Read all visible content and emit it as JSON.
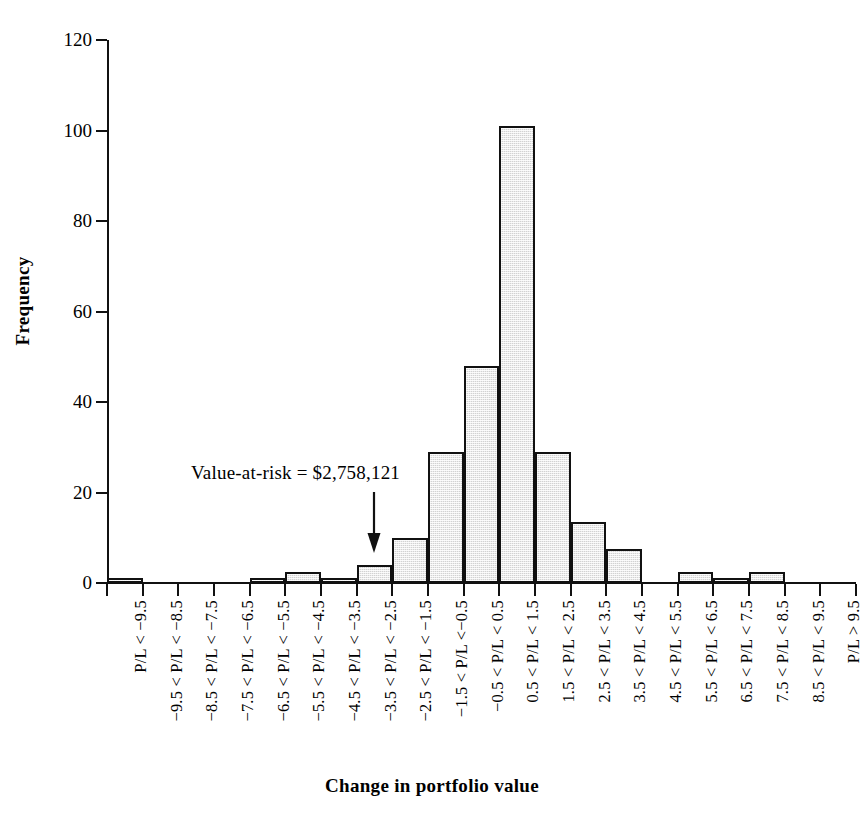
{
  "chart_data": {
    "type": "bar",
    "title": "",
    "subtitle": "",
    "xlabel": "Change in portfolio value",
    "ylabel": "Frequency",
    "ylim": [
      0,
      120
    ],
    "ytick_labels": [
      "0",
      "20",
      "40",
      "60",
      "80",
      "100",
      "120"
    ],
    "ytick_values": [
      0,
      20,
      40,
      60,
      80,
      100,
      120
    ],
    "grid": false,
    "legend": null,
    "bar_fill_color": "#d2d2d2",
    "bar_edge_color": "#111111",
    "categories": [
      "P/L < −9.5",
      "−9.5 < P/L < −8.5",
      "−8.5 < P/L < −7.5",
      "−7.5 < P/L < −6.5",
      "−6.5 < P/L < −5.5",
      "−5.5 < P/L < −4.5",
      "−4.5 < P/L < −3.5",
      "−3.5 < P/L < −2.5",
      "−2.5 < P/L < −1.5",
      "−1.5 < P/L <−0.5",
      "−0.5 < P/L < 0.5",
      "0.5 < P/L < 1.5",
      "1.5 < P/L < 2.5",
      "2.5 < P/L < 3.5",
      "3.5 < P/L < 4.5",
      "4.5 < P/L < 5.5",
      "5.5 < P/L < 6.5",
      "6.5 < P/L < 7.5",
      "7.5 < P/L < 8.5",
      "8.5 < P/L < 9.5",
      "P/L > 9.5"
    ],
    "values": [
      1,
      0,
      0,
      0,
      1,
      2.5,
      1,
      4,
      10,
      29,
      48,
      101,
      29,
      13.5,
      7.5,
      0,
      2.5,
      1,
      2.5,
      0,
      0
    ],
    "annotations": [
      {
        "text": "Value-at-risk = $2,758,121",
        "points_to_category": "−3.5 < P/L < −2.5",
        "arrow": "down-arrow"
      }
    ]
  }
}
